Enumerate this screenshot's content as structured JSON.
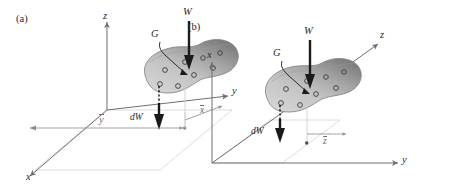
{
  "figure": {
    "type": "mechanics-diagram",
    "background_color": "#ffffff",
    "ink_color": "#2b2b2b",
    "axis_color": "#6f6f6f",
    "body_fill_light": "#c9c9c9",
    "body_fill_dark": "#8f8f8f",
    "body_outline": "#7a7a7a",
    "particle_outline": "#3d3d3d"
  },
  "panels": [
    {
      "id": "a",
      "tag": "(a)",
      "axes": [
        {
          "name": "z",
          "label": "z",
          "direction": "up"
        },
        {
          "name": "y",
          "label": "y",
          "direction": "right"
        },
        {
          "name": "x",
          "label": "x",
          "direction": "down-left"
        }
      ],
      "annotations": [
        {
          "name": "total-weight",
          "label": "W",
          "kind": "force-arrow",
          "direction": "down"
        },
        {
          "name": "centre-of-gravity",
          "label": "G",
          "kind": "leader-point"
        },
        {
          "name": "element-weight",
          "label": "dW",
          "kind": "force-arrow",
          "direction": "down"
        },
        {
          "name": "y-bar-dimension",
          "label": "y",
          "overbar": true,
          "kind": "dimension"
        },
        {
          "name": "x-bar-dimension",
          "label": "x",
          "overbar": true,
          "kind": "dimension"
        }
      ],
      "particle_count": 8
    },
    {
      "id": "b",
      "tag": "(b)",
      "axes": [
        {
          "name": "x",
          "label": "x",
          "direction": "up"
        },
        {
          "name": "y",
          "label": "y",
          "direction": "right"
        },
        {
          "name": "z",
          "label": "z",
          "direction": "up-right"
        }
      ],
      "annotations": [
        {
          "name": "total-weight",
          "label": "W",
          "kind": "force-arrow",
          "direction": "down"
        },
        {
          "name": "centre-of-gravity",
          "label": "G",
          "kind": "leader-point"
        },
        {
          "name": "element-weight",
          "label": "dW",
          "kind": "force-arrow",
          "direction": "down"
        },
        {
          "name": "z-bar-dimension",
          "label": "z",
          "overbar": true,
          "kind": "dimension"
        }
      ],
      "particle_count": 8
    }
  ]
}
